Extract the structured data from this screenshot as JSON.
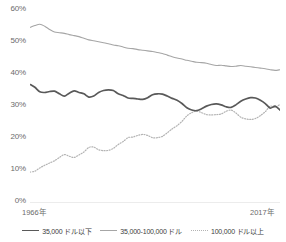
{
  "chart_data": {
    "type": "line",
    "title": "",
    "subtitle": "",
    "xlabel": "",
    "ylabel": "",
    "xlim": [
      1966,
      2017
    ],
    "ylim": [
      0,
      60
    ],
    "yticks": [
      "0%",
      "10%",
      "20%",
      "30%",
      "40%",
      "50%",
      "60%"
    ],
    "ytick_values": [
      0,
      10,
      20,
      30,
      40,
      50,
      60
    ],
    "xticks": [
      "1966年",
      "2017年"
    ],
    "xtick_values": [
      1966,
      2017
    ],
    "grid": false,
    "legend_position": "bottom",
    "x": [
      1966,
      1967,
      1968,
      1969,
      1970,
      1971,
      1972,
      1973,
      1974,
      1975,
      1976,
      1977,
      1978,
      1979,
      1980,
      1981,
      1982,
      1983,
      1984,
      1985,
      1986,
      1987,
      1988,
      1989,
      1990,
      1991,
      1992,
      1993,
      1994,
      1995,
      1996,
      1997,
      1998,
      1999,
      2000,
      2001,
      2002,
      2003,
      2004,
      2005,
      2006,
      2007,
      2008,
      2009,
      2010,
      2011,
      2012,
      2013,
      2014,
      2015,
      2016,
      2017
    ],
    "series": [
      {
        "name": "35,000 ドル以下",
        "style": "solid-dark",
        "color": "#595959",
        "values": [
          36.5,
          35.6,
          34.2,
          34.0,
          34.3,
          34.4,
          33.6,
          32.9,
          33.8,
          34.5,
          34.0,
          33.6,
          32.6,
          32.9,
          34.0,
          34.6,
          34.8,
          34.6,
          33.6,
          33.1,
          32.3,
          32.2,
          32.0,
          31.9,
          32.4,
          33.3,
          33.6,
          33.5,
          32.9,
          32.2,
          31.6,
          30.6,
          29.3,
          28.6,
          28.4,
          29.0,
          29.8,
          30.3,
          30.5,
          30.2,
          29.6,
          29.4,
          30.2,
          31.3,
          32.0,
          32.4,
          32.3,
          31.6,
          30.6,
          29.2,
          29.8,
          28.6
        ]
      },
      {
        "name": "35,000-100,000 ドル",
        "style": "solid-light",
        "color": "#a6a6a6",
        "values": [
          54.0,
          54.6,
          55.0,
          54.4,
          53.4,
          52.6,
          52.4,
          52.2,
          51.8,
          51.5,
          51.2,
          50.7,
          50.2,
          49.9,
          49.6,
          49.3,
          49.0,
          48.6,
          48.4,
          48.0,
          47.6,
          47.5,
          47.2,
          47.0,
          46.8,
          46.6,
          46.3,
          46.0,
          45.5,
          45.0,
          44.6,
          44.3,
          43.9,
          43.6,
          43.3,
          43.2,
          43.0,
          42.6,
          42.3,
          42.4,
          42.2,
          42.0,
          42.1,
          42.3,
          42.1,
          41.9,
          41.7,
          41.5,
          41.3,
          41.0,
          40.8,
          41.0
        ]
      },
      {
        "name": "100,000 ドル以上",
        "style": "dotted",
        "color": "#b3b3b3",
        "values": [
          9.5,
          9.8,
          10.8,
          11.6,
          12.3,
          13.0,
          14.0,
          14.9,
          14.4,
          14.0,
          14.8,
          15.7,
          17.1,
          17.2,
          16.4,
          16.1,
          16.2,
          16.8,
          18.0,
          18.9,
          20.1,
          20.3,
          20.8,
          21.1,
          20.8,
          20.1,
          20.1,
          20.5,
          21.6,
          22.8,
          23.8,
          25.1,
          26.8,
          27.8,
          28.3,
          27.8,
          27.2,
          27.1,
          27.2,
          27.4,
          28.2,
          28.6,
          27.7,
          26.4,
          25.9,
          25.7,
          26.0,
          26.9,
          28.1,
          29.8,
          29.4,
          30.4
        ]
      }
    ]
  },
  "legend": {
    "items": [
      {
        "label": "35,000 ドル以下",
        "style": "solid-dark"
      },
      {
        "label": "35,000-100,000 ドル",
        "style": "solid-light"
      },
      {
        "label": "100,000 ドル以上",
        "style": "dotted"
      }
    ]
  },
  "axes": {
    "y_labels": [
      "60%",
      "50%",
      "40%",
      "30%",
      "20%",
      "10%",
      "0%"
    ],
    "x_labels": [
      "1966年",
      "2017年"
    ]
  },
  "colors": {
    "series_dark": "#595959",
    "series_light": "#a6a6a6",
    "series_dotted": "#b3b3b3",
    "axis": "#d9d9d9",
    "text": "#6b6b6b"
  }
}
